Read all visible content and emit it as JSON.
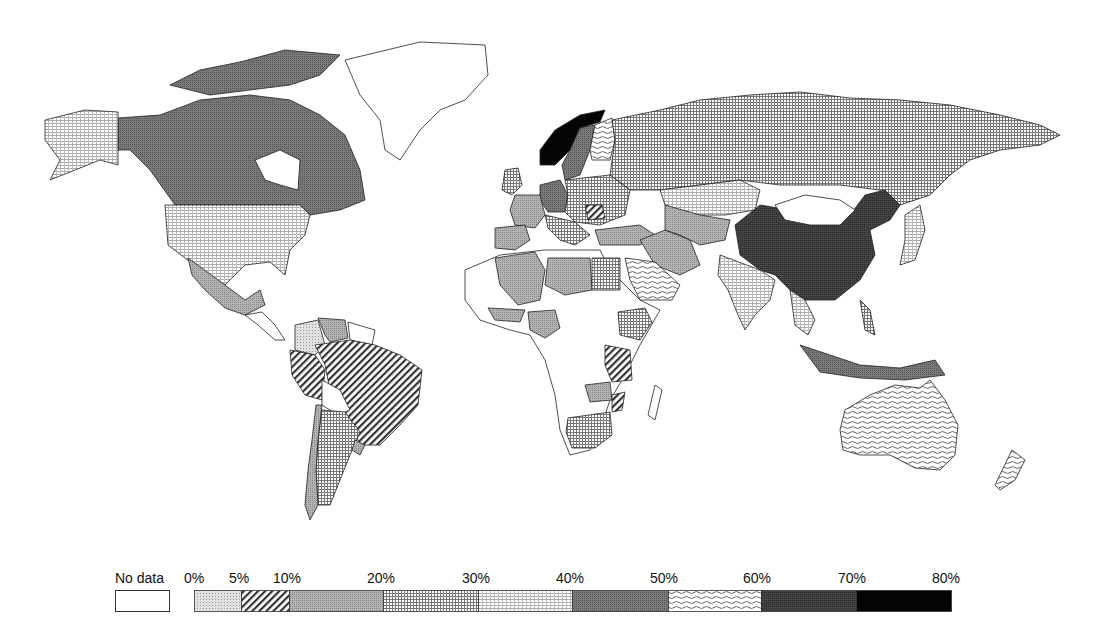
{
  "map": {
    "type": "choropleth",
    "projection": "world",
    "legend": {
      "no_data_label": "No data",
      "tick_labels": [
        "0%",
        "5%",
        "10%",
        "20%",
        "30%",
        "40%",
        "50%",
        "60%",
        "70%",
        "80%"
      ],
      "classes": [
        {
          "range": "No data",
          "pattern": "blank",
          "color": "#ffffff"
        },
        {
          "range": "0-5%",
          "pattern": "light-stipple",
          "color": "#d4d4d4"
        },
        {
          "range": "5-10%",
          "pattern": "diagonal-hatch",
          "color": "#555555"
        },
        {
          "range": "10-20%",
          "pattern": "medium-stipple",
          "color": "#a8a8a8"
        },
        {
          "range": "20-30%",
          "pattern": "grid-dense",
          "color": "#c0c0c0"
        },
        {
          "range": "30-40%",
          "pattern": "grid-light",
          "color": "#e2e2e2"
        },
        {
          "range": "40-50%",
          "pattern": "dark-stipple",
          "color": "#707070"
        },
        {
          "range": "50-60%",
          "pattern": "wavy",
          "color": "#cfcfcf"
        },
        {
          "range": "60-70%",
          "pattern": "very-dark-stipple",
          "color": "#3c3c3c"
        },
        {
          "range": "70-80%",
          "pattern": "solid-black",
          "color": "#050505"
        }
      ]
    },
    "regions": [
      {
        "name": "Canada",
        "class": "40-50%"
      },
      {
        "name": "United States",
        "class": "30-40%"
      },
      {
        "name": "Alaska",
        "class": "30-40%"
      },
      {
        "name": "Greenland",
        "class": "No data"
      },
      {
        "name": "Mexico",
        "class": "10-20%"
      },
      {
        "name": "Colombia",
        "class": "0-5%"
      },
      {
        "name": "Venezuela",
        "class": "10-20%"
      },
      {
        "name": "Brazil",
        "class": "5-10%"
      },
      {
        "name": "Peru",
        "class": "5-10%"
      },
      {
        "name": "Bolivia",
        "class": "No data"
      },
      {
        "name": "Argentina",
        "class": "20-30%"
      },
      {
        "name": "Chile",
        "class": "10-20%"
      },
      {
        "name": "Norway",
        "class": "70-80%"
      },
      {
        "name": "Sweden",
        "class": "40-50%"
      },
      {
        "name": "Finland",
        "class": "50-60%"
      },
      {
        "name": "Russia",
        "class": "20-30%"
      },
      {
        "name": "Kazakhstan",
        "class": "30-40%"
      },
      {
        "name": "Germany",
        "class": "40-50%"
      },
      {
        "name": "France",
        "class": "10-20%"
      },
      {
        "name": "Spain",
        "class": "10-20%"
      },
      {
        "name": "United Kingdom",
        "class": "20-30%"
      },
      {
        "name": "Romania",
        "class": "5-10%"
      },
      {
        "name": "Turkey",
        "class": "10-20%"
      },
      {
        "name": "Iran",
        "class": "10-20%"
      },
      {
        "name": "China",
        "class": "60-70%"
      },
      {
        "name": "Mongolia",
        "class": "No data"
      },
      {
        "name": "India",
        "class": "30-40%"
      },
      {
        "name": "Japan",
        "class": "30-40%"
      },
      {
        "name": "Indonesia",
        "class": "40-50%"
      },
      {
        "name": "Australia",
        "class": "50-60%"
      },
      {
        "name": "New Zealand",
        "class": "50-60%"
      },
      {
        "name": "Algeria",
        "class": "10-20%"
      },
      {
        "name": "Libya",
        "class": "10-20%"
      },
      {
        "name": "Egypt",
        "class": "20-30%"
      },
      {
        "name": "Saudi Arabia",
        "class": "50-60%"
      },
      {
        "name": "Nigeria",
        "class": "10-20%"
      },
      {
        "name": "Ethiopia",
        "class": "20-30%"
      },
      {
        "name": "Tanzania",
        "class": "5-10%"
      },
      {
        "name": "Zambia",
        "class": "10-20%"
      },
      {
        "name": "Mozambique",
        "class": "5-10%"
      },
      {
        "name": "South Africa",
        "class": "20-30%"
      }
    ]
  }
}
